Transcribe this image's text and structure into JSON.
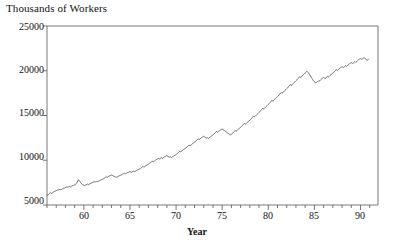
{
  "chart_data": {
    "type": "line",
    "title": "",
    "ylabel": "Thousands of Workers",
    "xlabel": "Year",
    "grid": false,
    "legend": null,
    "xlim": [
      56.0,
      91.9
    ],
    "ylim": [
      5000,
      25000
    ],
    "ytick_labels": [
      "25000",
      "20000",
      "15000",
      "10000",
      "5000"
    ],
    "ytick_values": [
      25000,
      20000,
      15000,
      10000,
      5000
    ],
    "xtick_labels": [
      "60",
      "65",
      "70",
      "75",
      "80",
      "85",
      "90"
    ],
    "xtick_values": [
      60,
      65,
      70,
      75,
      80,
      85,
      90
    ],
    "xminor_step": 1,
    "line_color": "#333333",
    "axis_color": "#555555",
    "background": "#ffffff",
    "series": [
      {
        "name": "Thousands of Workers",
        "x_start": 56.0,
        "x_step": 0.0833,
        "values": [
          6050,
          6120,
          6210,
          6280,
          6320,
          6380,
          6300,
          6350,
          6420,
          6480,
          6520,
          6560,
          6600,
          6650,
          6700,
          6680,
          6720,
          6760,
          6700,
          6740,
          6800,
          6850,
          6880,
          6900,
          6950,
          6980,
          7020,
          6990,
          7030,
          7080,
          7000,
          7050,
          7100,
          7150,
          7180,
          7200,
          7250,
          7300,
          7380,
          7500,
          7680,
          7820,
          7700,
          7600,
          7480,
          7380,
          7300,
          7250,
          7200,
          7180,
          7220,
          7260,
          7300,
          7340,
          7280,
          7320,
          7380,
          7420,
          7460,
          7500,
          7540,
          7560,
          7600,
          7580,
          7620,
          7660,
          7600,
          7650,
          7700,
          7750,
          7790,
          7820,
          7860,
          7900,
          7960,
          8020,
          8090,
          8160,
          8080,
          8120,
          8180,
          8230,
          8270,
          8300,
          8340,
          8300,
          8260,
          8220,
          8180,
          8140,
          8080,
          8120,
          8170,
          8220,
          8260,
          8300,
          8340,
          8380,
          8430,
          8480,
          8520,
          8560,
          8480,
          8520,
          8570,
          8620,
          8660,
          8700,
          8740,
          8700,
          8660,
          8700,
          8750,
          8800,
          8720,
          8770,
          8830,
          8880,
          8920,
          8960,
          9000,
          9050,
          9110,
          9180,
          9250,
          9320,
          9230,
          9280,
          9350,
          9410,
          9460,
          9500,
          9560,
          9620,
          9690,
          9760,
          9830,
          9900,
          9800,
          9860,
          9930,
          10000,
          10060,
          10100,
          10160,
          10200,
          10140,
          10180,
          10240,
          10300,
          10200,
          10250,
          10320,
          10380,
          10430,
          10470,
          10520,
          10470,
          10410,
          10360,
          10320,
          10380,
          10300,
          10350,
          10420,
          10480,
          10530,
          10580,
          10640,
          10700,
          10780,
          10860,
          10940,
          11020,
          10930,
          10990,
          11070,
          11140,
          11200,
          11250,
          11320,
          11380,
          11460,
          11540,
          11620,
          11700,
          11600,
          11660,
          11740,
          11820,
          11890,
          11950,
          12020,
          12080,
          12160,
          12240,
          12320,
          12400,
          12300,
          12360,
          12440,
          12510,
          12570,
          12620,
          12680,
          12620,
          12560,
          12500,
          12460,
          12520,
          12440,
          12500,
          12570,
          12640,
          12700,
          12760,
          12830,
          12900,
          12980,
          13060,
          13140,
          13220,
          13120,
          13180,
          13260,
          13330,
          13390,
          13440,
          13500,
          13440,
          13380,
          13320,
          13260,
          13200,
          13120,
          13060,
          13000,
          12940,
          12880,
          12840,
          12900,
          12970,
          13050,
          13140,
          13230,
          13320,
          13230,
          13300,
          13390,
          13470,
          13540,
          13600,
          13680,
          13760,
          13850,
          13940,
          14030,
          14120,
          14020,
          14090,
          14180,
          14260,
          14330,
          14390,
          14470,
          14550,
          14650,
          14750,
          14850,
          14950,
          14840,
          14920,
          15010,
          15100,
          15180,
          15250,
          15340,
          15420,
          15520,
          15620,
          15720,
          15820,
          15710,
          15790,
          15890,
          15980,
          16060,
          16130,
          16220,
          16300,
          16400,
          16500,
          16600,
          16700,
          16590,
          16670,
          16770,
          16860,
          16940,
          17010,
          17100,
          17180,
          17280,
          17380,
          17480,
          17580,
          17470,
          17550,
          17650,
          17740,
          17820,
          17890,
          17980,
          18060,
          18160,
          18260,
          18360,
          18460,
          18350,
          18430,
          18530,
          18620,
          18700,
          18770,
          18860,
          18940,
          19040,
          19140,
          19240,
          19340,
          19230,
          19310,
          19410,
          19500,
          19580,
          19650,
          19740,
          19820,
          19920,
          19900,
          19800,
          19700,
          19560,
          19420,
          19280,
          19140,
          19000,
          18880,
          18780,
          18700,
          18650,
          18700,
          18780,
          18870,
          18800,
          18880,
          18970,
          19050,
          19120,
          19180,
          19260,
          19200,
          19140,
          19200,
          19280,
          19360,
          19280,
          19350,
          19440,
          19520,
          19590,
          19650,
          19730,
          19800,
          19880,
          19960,
          20040,
          20120,
          20020,
          20090,
          20180,
          20260,
          20330,
          20390,
          20470,
          20420,
          20360,
          20420,
          20500,
          20580,
          20490,
          20560,
          20650,
          20720,
          20790,
          20850,
          20920,
          20870,
          20810,
          20870,
          20950,
          21030,
          20940,
          21010,
          21100,
          21180,
          21250,
          21310,
          21380,
          21330,
          21270,
          21330,
          21410,
          21490,
          21400,
          21300,
          21200,
          21150,
          21230,
          21320
        ]
      }
    ]
  },
  "axes": {
    "ylabel_text": "Thousands of Workers",
    "xlabel_text": "Year"
  }
}
